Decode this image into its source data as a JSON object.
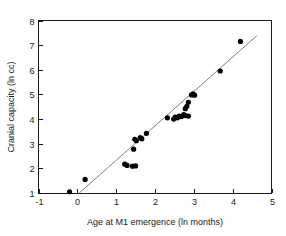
{
  "chart_data": {
    "type": "scatter",
    "title": "",
    "xlabel": "Age at M1 emergence (ln months)",
    "ylabel": "Cranial capacity (ln cc)",
    "xlim": [
      -1,
      5
    ],
    "ylim": [
      1,
      8
    ],
    "xticks": [
      -1,
      0,
      1,
      2,
      3,
      4,
      5
    ],
    "yticks": [
      1,
      2,
      3,
      4,
      5,
      6,
      7,
      8
    ],
    "xtick_labels": [
      "-1",
      "0",
      "1",
      "2",
      "3",
      "4",
      "5"
    ],
    "ytick_labels": [
      "1",
      "2",
      "3",
      "4",
      "5",
      "6",
      "7",
      "8"
    ],
    "grid": false,
    "legend": "none",
    "marker": "filled-circle",
    "marker_color": "#000000",
    "points": [
      [
        -0.2,
        1.05
      ],
      [
        0.2,
        1.55
      ],
      [
        1.22,
        2.17
      ],
      [
        1.28,
        2.12
      ],
      [
        1.42,
        2.09
      ],
      [
        1.5,
        2.1
      ],
      [
        1.45,
        2.78
      ],
      [
        1.48,
        3.18
      ],
      [
        1.52,
        3.12
      ],
      [
        1.62,
        3.25
      ],
      [
        1.66,
        3.2
      ],
      [
        1.78,
        3.42
      ],
      [
        2.32,
        4.05
      ],
      [
        2.48,
        4.0
      ],
      [
        2.52,
        4.08
      ],
      [
        2.58,
        4.05
      ],
      [
        2.62,
        4.12
      ],
      [
        2.68,
        4.1
      ],
      [
        2.74,
        4.18
      ],
      [
        2.78,
        4.14
      ],
      [
        2.86,
        4.12
      ],
      [
        2.78,
        4.42
      ],
      [
        2.82,
        4.52
      ],
      [
        2.86,
        4.68
      ],
      [
        2.94,
        4.98
      ],
      [
        2.98,
        5.02
      ],
      [
        3.02,
        4.97
      ],
      [
        3.68,
        5.95
      ],
      [
        4.2,
        7.15
      ]
    ],
    "fit_line": {
      "type": "linear-regression",
      "x_start": 0.05,
      "y_start": 1.0,
      "x_end": 4.62,
      "y_end": 7.38,
      "color": "#6e6e6e"
    }
  },
  "axes": {
    "frame_color": "#1a1a1a",
    "background": "#ffffff"
  }
}
